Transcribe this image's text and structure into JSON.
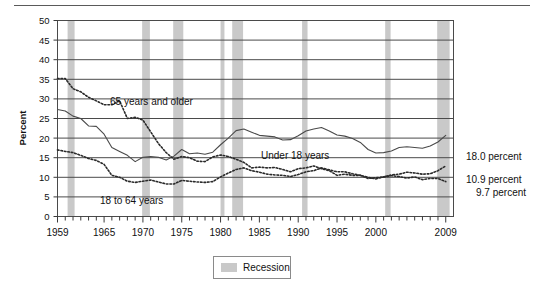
{
  "chart_data": {
    "type": "line",
    "title": "",
    "xlabel": "",
    "ylabel": "Percent",
    "ylim": [
      0,
      50
    ],
    "ytick_step": 5,
    "yticks": [
      "0",
      "5",
      "10",
      "15",
      "20",
      "25",
      "30",
      "35",
      "40",
      "45",
      "50"
    ],
    "xlim": [
      1959,
      2010
    ],
    "xticks": [
      "1959",
      "1965",
      "1970",
      "1975",
      "1980",
      "1985",
      "1990",
      "1995",
      "2000",
      "2009"
    ],
    "xtick_values": [
      1959,
      1965,
      1970,
      1975,
      1980,
      1985,
      1990,
      1995,
      2000,
      2009
    ],
    "minor_tick_interval": 1,
    "grid": "horizontal",
    "legend_position": "bottom-center",
    "x": [
      1959,
      1960,
      1961,
      1962,
      1963,
      1964,
      1965,
      1966,
      1967,
      1968,
      1969,
      1970,
      1971,
      1972,
      1973,
      1974,
      1975,
      1976,
      1977,
      1978,
      1979,
      1980,
      1981,
      1982,
      1983,
      1984,
      1985,
      1986,
      1987,
      1988,
      1989,
      1990,
      1991,
      1992,
      1993,
      1994,
      1995,
      1996,
      1997,
      1998,
      1999,
      2000,
      2001,
      2002,
      2003,
      2004,
      2005,
      2006,
      2007,
      2008,
      2009
    ],
    "series": [
      {
        "name": "Under 18 years",
        "label": "Under 18 years",
        "style": "solid",
        "color": "#4a4a4a",
        "end_value": 20.7,
        "values": [
          27.3,
          26.9,
          25.6,
          25.0,
          23.1,
          23.0,
          21.0,
          17.6,
          16.6,
          15.6,
          14.0,
          15.1,
          15.3,
          15.1,
          14.4,
          15.4,
          17.1,
          16.0,
          16.2,
          15.9,
          16.4,
          18.3,
          20.0,
          21.9,
          22.3,
          21.5,
          20.7,
          20.5,
          20.3,
          19.5,
          19.6,
          20.6,
          21.8,
          22.3,
          22.7,
          21.8,
          20.8,
          20.5,
          19.9,
          18.9,
          17.1,
          16.2,
          16.3,
          16.7,
          17.6,
          17.8,
          17.6,
          17.4,
          18.0,
          19.0,
          20.7
        ]
      },
      {
        "name": "18 to 64 years",
        "label": "18 to 64 years",
        "style": "dotted",
        "color": "#2a2a2a",
        "end_value": 12.9,
        "values": [
          17.0,
          16.6,
          16.3,
          15.6,
          14.8,
          14.3,
          13.3,
          10.5,
          10.0,
          9.0,
          8.7,
          9.0,
          9.3,
          8.8,
          8.3,
          8.3,
          9.2,
          9.0,
          8.8,
          8.7,
          8.9,
          10.1,
          11.1,
          12.0,
          12.4,
          11.7,
          11.3,
          10.8,
          10.6,
          10.5,
          10.2,
          10.7,
          11.4,
          11.7,
          12.4,
          11.9,
          11.4,
          11.4,
          10.9,
          10.5,
          10.0,
          9.6,
          10.1,
          10.6,
          10.8,
          11.3,
          11.1,
          10.8,
          10.9,
          11.7,
          12.9
        ]
      },
      {
        "name": "65 years and older",
        "label": "65 years and older",
        "style": "dotted",
        "color": "#2a2a2a",
        "end_value": 8.9,
        "values": [
          35.2,
          35.2,
          32.6,
          31.8,
          30.4,
          29.5,
          28.5,
          28.5,
          29.5,
          25.0,
          25.3,
          24.6,
          21.6,
          18.6,
          16.3,
          14.6,
          15.3,
          15.0,
          14.1,
          14.0,
          15.2,
          15.7,
          15.3,
          14.6,
          13.8,
          12.4,
          12.6,
          12.4,
          12.5,
          12.0,
          11.4,
          12.2,
          12.4,
          12.9,
          12.2,
          11.7,
          10.5,
          10.8,
          10.5,
          10.5,
          9.7,
          9.9,
          10.1,
          10.4,
          10.2,
          9.8,
          10.1,
          9.4,
          9.7,
          9.7,
          8.9
        ]
      }
    ],
    "endpoint_annotations": [
      {
        "value": "18.0 percent",
        "series": "Under 18 years"
      },
      {
        "value": "10.9 percent",
        "series": "18 to 64 years"
      },
      {
        "value": "9.7 percent",
        "series": "65 years and older"
      }
    ],
    "recessions": [
      {
        "start": 1960.3,
        "end": 1961.2
      },
      {
        "start": 1969.9,
        "end": 1970.9
      },
      {
        "start": 1973.9,
        "end": 1975.2
      },
      {
        "start": 1980.0,
        "end": 1980.5
      },
      {
        "start": 1981.5,
        "end": 1982.9
      },
      {
        "start": 1990.5,
        "end": 1991.2
      },
      {
        "start": 2001.2,
        "end": 2001.9
      },
      {
        "start": 2007.9,
        "end": 2009.5
      }
    ],
    "recession_color": "#c9c9c9",
    "legend": {
      "label": "Recession",
      "swatch_color": "#c9c9c9"
    },
    "axis_color": "#3a3a3a",
    "gridline_color": "#4a4a4a"
  }
}
